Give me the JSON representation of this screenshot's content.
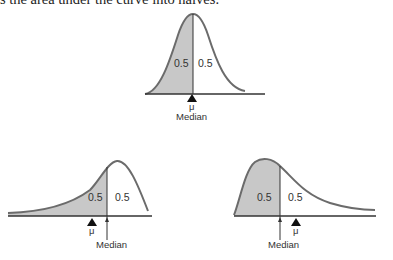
{
  "caption": "s the area under the curve into halves.",
  "diagrams": [
    {
      "name": "symmetric",
      "left_area": "0.5",
      "right_area": "0.5",
      "mu_label": "μ",
      "median_label": "Median"
    },
    {
      "name": "left-skewed",
      "left_area": "0.5",
      "right_area": "0.5",
      "mu_label": "μ",
      "median_label": "Median"
    },
    {
      "name": "right-skewed",
      "left_area": "0.5",
      "right_area": "0.5",
      "mu_label": "μ",
      "median_label": "Median"
    }
  ],
  "colors": {
    "curve": "#6b6b6b",
    "shade": "#c8c8c8",
    "axis": "#333333"
  }
}
